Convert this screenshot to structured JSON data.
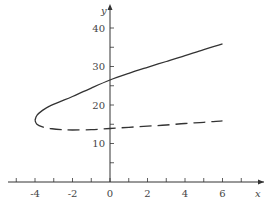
{
  "chart_data": {
    "type": "line",
    "title": "",
    "xlabel": "x",
    "ylabel": "y",
    "xlim": [
      -5.3,
      8.3
    ],
    "ylim": [
      0,
      46
    ],
    "x_ticks_major": [
      -4,
      -2,
      0,
      2,
      4,
      6
    ],
    "x_tick_labels": [
      "-4",
      "-2",
      "0",
      "2",
      "4",
      "6"
    ],
    "x_ticks_minor": [
      -5,
      -3,
      -1,
      1,
      3,
      5,
      7
    ],
    "y_ticks_major": [
      10,
      20,
      30,
      40
    ],
    "y_tick_labels": [
      "10",
      "20",
      "30",
      "40"
    ],
    "y_ticks_minor": [
      5,
      15,
      25,
      35
    ],
    "grid": false,
    "series": [
      {
        "name": "upper-branch",
        "style": "solid",
        "points": [
          [
            -4,
            16
          ],
          [
            -3.9,
            17.3
          ],
          [
            -3.6,
            18.6
          ],
          [
            -3.2,
            19.8
          ],
          [
            -2.6,
            21.0
          ],
          [
            -2,
            22.2
          ],
          [
            -1,
            24.4
          ],
          [
            0,
            26.5
          ],
          [
            1,
            28.2
          ],
          [
            2,
            29.8
          ],
          [
            3,
            31.3
          ],
          [
            4,
            32.8
          ],
          [
            5,
            34.4
          ],
          [
            6,
            35.9
          ]
        ]
      },
      {
        "name": "lower-branch",
        "style": "dashed",
        "points": [
          [
            -4,
            16
          ],
          [
            -3.9,
            15.0
          ],
          [
            -3.6,
            14.3
          ],
          [
            -3.2,
            13.9
          ],
          [
            -2.6,
            13.6
          ],
          [
            -2,
            13.5
          ],
          [
            -1,
            13.6
          ],
          [
            0,
            13.9
          ],
          [
            1,
            14.2
          ],
          [
            2,
            14.5
          ],
          [
            3,
            14.8
          ],
          [
            4,
            15.2
          ],
          [
            5,
            15.5
          ],
          [
            6,
            15.9
          ]
        ]
      }
    ]
  }
}
